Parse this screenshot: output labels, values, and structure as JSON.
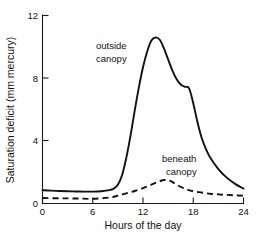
{
  "chart_data": {
    "type": "line",
    "title": "",
    "xlabel": "Hours of the day",
    "ylabel": "Saturation deficit (mm mercury)",
    "xlim": [
      0,
      24
    ],
    "ylim": [
      0,
      12
    ],
    "xticks": [
      "0",
      "6",
      "12",
      "18",
      "24"
    ],
    "xtick_values": [
      0,
      6,
      12,
      18,
      24
    ],
    "yticks": [
      "0",
      "4",
      "8",
      "12"
    ],
    "ytick_values": [
      0,
      4,
      8,
      12
    ],
    "grid": false,
    "legend": "inline-annotations",
    "series": [
      {
        "name": "outside canopy",
        "style": "solid",
        "annotation": {
          "line1": "outside",
          "line2": "canopy"
        },
        "x": [
          0,
          1,
          2,
          3,
          4,
          5,
          6,
          7,
          8,
          8.5,
          9,
          9.5,
          10,
          10.5,
          11,
          11.5,
          12,
          12.5,
          13,
          13.5,
          14,
          14.5,
          15,
          15.5,
          16,
          16.5,
          17,
          17.5,
          18,
          18.5,
          19,
          19.5,
          20,
          21,
          22,
          23,
          24
        ],
        "y": [
          0.85,
          0.82,
          0.8,
          0.78,
          0.77,
          0.76,
          0.76,
          0.78,
          0.85,
          0.95,
          1.2,
          1.8,
          2.9,
          4.3,
          5.9,
          7.4,
          8.7,
          9.7,
          10.4,
          10.6,
          10.45,
          9.9,
          9.2,
          8.5,
          7.95,
          7.6,
          7.45,
          7.35,
          6.4,
          5.2,
          4.2,
          3.5,
          2.95,
          2.2,
          1.65,
          1.25,
          0.95
        ]
      },
      {
        "name": "beneath canopy",
        "style": "dashed",
        "annotation": {
          "line1": "beneath",
          "line2": "canopy"
        },
        "x": [
          0,
          2,
          4,
          6,
          8,
          9,
          10,
          11,
          12,
          13,
          14,
          14.5,
          15,
          15.5,
          16,
          17,
          18,
          19,
          20,
          21,
          22,
          23,
          24
        ],
        "y": [
          0.35,
          0.33,
          0.32,
          0.3,
          0.38,
          0.5,
          0.65,
          0.8,
          0.98,
          1.2,
          1.42,
          1.5,
          1.48,
          1.38,
          1.2,
          0.95,
          0.78,
          0.7,
          0.62,
          0.58,
          0.55,
          0.52,
          0.5
        ]
      }
    ]
  },
  "axes": {
    "y_title": "Saturation deficit (mm mercury)",
    "x_title": "Hours of the day",
    "y_tick_labels": [
      "12",
      "8",
      "4",
      "0"
    ],
    "x_tick_labels": [
      "0",
      "6",
      "12",
      "18",
      "24"
    ]
  },
  "annotations": {
    "outside": {
      "line1": "outside",
      "line2": "canopy"
    },
    "beneath": {
      "line1": "beneath",
      "line2": "canopy"
    }
  },
  "colors": {
    "ink": "#111111",
    "background": "#ffffff"
  }
}
